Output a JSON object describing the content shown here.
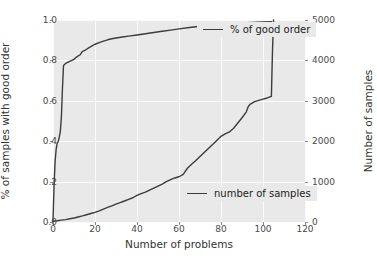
{
  "chart_data": {
    "type": "line",
    "title": "",
    "xlabel": "Number of problems",
    "ylabel_left": "% of samples with good order",
    "ylabel_right": "Number of samples",
    "xlim": [
      0,
      120
    ],
    "ylim_left": [
      0.0,
      1.0
    ],
    "ylim_right": [
      0,
      5000
    ],
    "grid": true,
    "legend_position": "inside (upper-right and lower-right)",
    "xticks": [
      "0",
      "20",
      "40",
      "60",
      "80",
      "100",
      "120"
    ],
    "xtick_values": [
      0,
      20,
      40,
      60,
      80,
      100,
      120
    ],
    "yticks_left": [
      "0.0",
      "0.2",
      "0.4",
      "0.6",
      "0.8",
      "1.0"
    ],
    "ytick_values_left": [
      0.0,
      0.2,
      0.4,
      0.6,
      0.8,
      1.0
    ],
    "yticks_right": [
      "0",
      "1000",
      "2000",
      "3000",
      "4000",
      "5000"
    ],
    "ytick_values_right": [
      0,
      1000,
      2000,
      3000,
      4000,
      5000
    ],
    "series": [
      {
        "name": "% of good order",
        "axis": "left",
        "color": "#3c3c3c",
        "x": [
          0,
          0.5,
          1,
          1.5,
          2,
          2.5,
          3,
          3.5,
          4,
          4.5,
          5,
          6,
          7,
          8,
          9,
          10,
          11,
          12,
          13,
          14,
          15,
          16,
          17,
          18,
          19,
          20,
          22,
          24,
          26,
          28,
          30,
          33,
          36,
          40,
          44,
          48,
          52,
          56,
          60,
          65,
          70,
          75,
          80,
          85,
          90,
          95,
          100,
          104
        ],
        "y": [
          0.005,
          0.18,
          0.3,
          0.36,
          0.39,
          0.4,
          0.42,
          0.45,
          0.52,
          0.66,
          0.775,
          0.785,
          0.79,
          0.795,
          0.8,
          0.805,
          0.815,
          0.822,
          0.828,
          0.845,
          0.848,
          0.855,
          0.862,
          0.868,
          0.874,
          0.88,
          0.888,
          0.895,
          0.902,
          0.907,
          0.911,
          0.916,
          0.92,
          0.926,
          0.932,
          0.938,
          0.944,
          0.95,
          0.956,
          0.963,
          0.969,
          0.974,
          0.978,
          0.982,
          0.985,
          0.988,
          0.99,
          0.992
        ]
      },
      {
        "name": "number of samples",
        "axis": "right",
        "color": "#3c3c3c",
        "x": [
          0,
          2,
          4,
          6,
          8,
          10,
          12,
          14,
          16,
          18,
          20,
          22,
          24,
          26,
          28,
          30,
          32,
          34,
          36,
          38,
          40,
          42,
          44,
          46,
          48,
          50,
          52,
          54,
          56,
          58,
          60,
          62,
          64,
          66,
          68,
          70,
          72,
          74,
          76,
          78,
          80,
          82,
          84,
          86,
          88,
          90,
          92,
          93,
          94,
          96,
          98,
          100,
          102,
          103,
          104,
          104.5,
          105
        ],
        "y": [
          20,
          30,
          45,
          60,
          80,
          100,
          125,
          150,
          180,
          210,
          240,
          275,
          320,
          360,
          400,
          440,
          480,
          520,
          560,
          600,
          660,
          700,
          740,
          790,
          840,
          890,
          940,
          1000,
          1050,
          1090,
          1120,
          1180,
          1330,
          1430,
          1520,
          1620,
          1720,
          1820,
          1920,
          2020,
          2120,
          2180,
          2230,
          2320,
          2450,
          2580,
          2720,
          2860,
          2920,
          2980,
          3010,
          3040,
          3070,
          3090,
          3110,
          4200,
          5000
        ]
      }
    ]
  },
  "legends": {
    "good_order": "% of good order",
    "number_of_samples": "number of samples"
  },
  "colors": {
    "plot_background": "#e9e9e9",
    "figure_background": "#ffffff",
    "line": "#3c3c3c",
    "gridline": "#fbfbfb",
    "tick_text": "#4a4a4a",
    "axis_title": "#333333"
  }
}
